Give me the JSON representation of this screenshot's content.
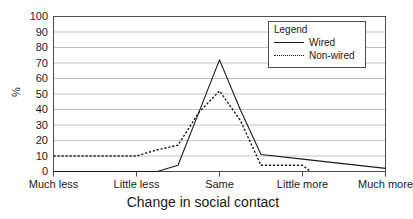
{
  "chart_data": {
    "type": "line",
    "title": "",
    "xlabel": "Change in social contact",
    "ylabel": "%",
    "categories": [
      "Much less",
      "Little less",
      "Same",
      "Little more",
      "Much more"
    ],
    "ylim": [
      0,
      100
    ],
    "xlim": [
      0,
      4
    ],
    "y_ticks": [
      0,
      10,
      20,
      30,
      40,
      50,
      60,
      70,
      80,
      90,
      100
    ],
    "grid": "horizontal",
    "legend_position": "top-right",
    "legend_title": "Legend",
    "series": [
      {
        "name": "Wired",
        "style": "solid",
        "color": "#1a1a1a",
        "x": [
          0,
          0.5,
          1.0,
          1.25,
          1.5,
          1.75,
          2.0,
          2.25,
          2.5,
          3.0,
          4.0
        ],
        "values": [
          0,
          0,
          0,
          0,
          4,
          38,
          72,
          40,
          11,
          8,
          2
        ]
      },
      {
        "name": "Non-wired",
        "style": "dotted",
        "color": "#1a1a1a",
        "x": [
          0,
          0.5,
          1.0,
          1.25,
          1.5,
          1.75,
          2.0,
          2.25,
          2.5,
          3.0,
          3.1
        ],
        "values": [
          10,
          10,
          10,
          14,
          17,
          38,
          52,
          33,
          4,
          4,
          0
        ]
      }
    ]
  },
  "axes": {
    "y_tick_labels": [
      "100",
      "90",
      "80",
      "70",
      "60",
      "50",
      "40",
      "30",
      "20",
      "10",
      "0"
    ],
    "y_title": "%",
    "x_title": "Change in social contact",
    "x_tick_labels": [
      "Much less",
      "Little less",
      "Same",
      "Little more",
      "Much more"
    ]
  },
  "legend": {
    "title": "Legend",
    "entries": [
      {
        "label": "Wired",
        "style": "solid"
      },
      {
        "label": "Non-wired",
        "style": "dotted"
      }
    ]
  }
}
